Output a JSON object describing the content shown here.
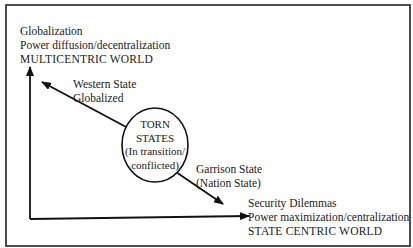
{
  "diagram": {
    "top_label": {
      "line1": "Globalization",
      "line2": "Power diffusion/decentralization",
      "line3": "MULTICENTRIC WORLD"
    },
    "upper_arrow_label": {
      "line1": "Western State",
      "line2": "Globalized"
    },
    "center_node": {
      "line1": "TORN",
      "line2": "STATES",
      "line3": "(In transition/",
      "line4": "conflicted)"
    },
    "lower_arrow_label": {
      "line1": "Garrison State",
      "line2": "(Nation State)"
    },
    "bottom_label": {
      "line1": "Security Dilemmas",
      "line2": "Power maximization/centralization",
      "line3": "STATE CENTRIC WORLD"
    }
  }
}
